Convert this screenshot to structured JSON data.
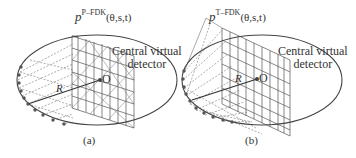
{
  "panels": [
    {
      "id": "a",
      "title_base": "p",
      "title_sup": "P–FDK",
      "title_args": "(θ,s,t)",
      "detector_label_line1": "Central virtual",
      "detector_label_line2": "detector",
      "radius_label": "R",
      "origin_label": "O",
      "caption": "(a)"
    },
    {
      "id": "b",
      "title_base": "p",
      "title_sup": "T–FDK",
      "title_args": "(θ,s,t)",
      "detector_label_line1": "Central virtual",
      "detector_label_line2": "detector",
      "radius_label": "R",
      "origin_label": "O",
      "caption": "(b)"
    }
  ],
  "colors": {
    "stroke": "#444444",
    "grid": "#666666",
    "dot": "#555555"
  }
}
